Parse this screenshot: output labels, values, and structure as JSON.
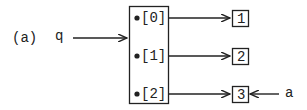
{
  "label": "(a)",
  "pointer_q": "q",
  "pointer_a": "a",
  "array": {
    "slots": [
      "[0]",
      "[1]",
      "[2]"
    ]
  },
  "targets": [
    "1",
    "2",
    "3"
  ],
  "colors": {
    "stroke": "#222222",
    "background": "#ffffff"
  }
}
